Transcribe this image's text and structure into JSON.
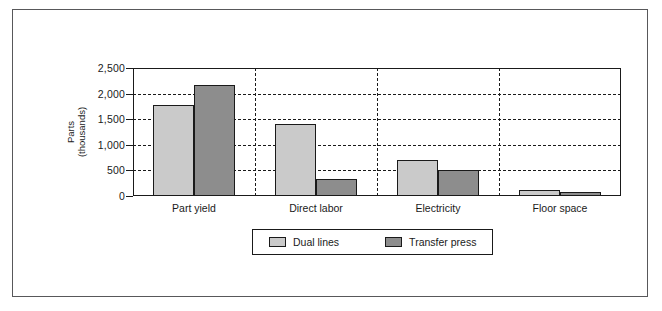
{
  "chart_data": {
    "type": "bar",
    "title": "",
    "xlabel": "",
    "ylabel": "Parts (thousands)",
    "ylabel_line1": "Parts",
    "ylabel_line2": "(thousands)",
    "categories": [
      "Part yield",
      "Direct labor",
      "Electricity",
      "Floor space"
    ],
    "series": [
      {
        "name": "Dual lines",
        "color": "#cacaca",
        "values": [
          1780,
          1400,
          700,
          110
        ]
      },
      {
        "name": "Transfer press",
        "color": "#8d8d8d",
        "values": [
          2170,
          330,
          500,
          70
        ]
      }
    ],
    "ylim": [
      0,
      2500
    ],
    "yticks": [
      0,
      500,
      1000,
      1500,
      2000,
      2500
    ],
    "ytick_labels": [
      "0",
      "500",
      "1,000",
      "1,500",
      "2,000",
      "2,500"
    ],
    "grid": true,
    "grid_style": "dashed",
    "group_separators": true,
    "legend_position": "bottom",
    "bar_edge_color": "#1a1a1a",
    "axis_color": "#1a1a1a",
    "frame_color": "#58585a",
    "background": "#ffffff"
  }
}
